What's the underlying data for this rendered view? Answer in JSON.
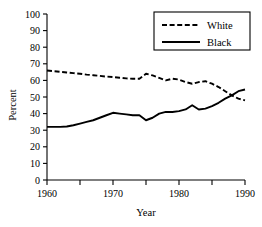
{
  "chart_data": {
    "type": "line",
    "title": "",
    "xlabel": "Year",
    "ylabel": "Percent",
    "xlim": [
      1960,
      1990
    ],
    "ylim": [
      0,
      100
    ],
    "grid": false,
    "legend_position": "top-right",
    "x_ticks_major": [
      1960,
      1970,
      1980,
      1990
    ],
    "x_ticks_minor": [
      1965,
      1975,
      1985
    ],
    "x_tick_labels": [
      "1960",
      "1970",
      "1980",
      "1990"
    ],
    "y_ticks": [
      0,
      10,
      20,
      30,
      40,
      50,
      60,
      70,
      80,
      90,
      100
    ],
    "y_tick_labels": [
      "0",
      "10",
      "20",
      "30",
      "40",
      "50",
      "60",
      "70",
      "80",
      "90",
      "100"
    ],
    "x": [
      1960,
      1961,
      1962,
      1963,
      1964,
      1965,
      1966,
      1967,
      1968,
      1969,
      1970,
      1971,
      1972,
      1973,
      1974,
      1975,
      1976,
      1977,
      1978,
      1979,
      1980,
      1981,
      1982,
      1983,
      1984,
      1985,
      1986,
      1987,
      1988,
      1989,
      1990
    ],
    "series": [
      {
        "name": "White",
        "style": "dashed",
        "color": "#000000",
        "values": [
          66,
          65.6,
          65.2,
          64.8,
          64.4,
          64,
          63.5,
          63.1,
          62.7,
          62.3,
          62,
          61.6,
          61.2,
          61,
          61,
          64,
          63,
          61.5,
          60,
          61,
          60.5,
          59,
          58,
          59,
          59.5,
          58,
          56,
          53.5,
          51,
          49,
          48
        ]
      },
      {
        "name": "Black",
        "style": "solid",
        "color": "#000000",
        "values": [
          32,
          32,
          32,
          32.2,
          33,
          34,
          35,
          36,
          37.5,
          39,
          40.5,
          40,
          39.5,
          39,
          39,
          36,
          37.5,
          40,
          41,
          41,
          41.5,
          42.5,
          45,
          42.5,
          43,
          44.5,
          46.5,
          49,
          51,
          53.5,
          54.5
        ]
      }
    ],
    "legend": [
      {
        "label": "White",
        "style": "dashed"
      },
      {
        "label": "Black",
        "style": "solid"
      }
    ]
  },
  "geometry": {
    "plot_left": 47,
    "plot_right": 245,
    "plot_top": 14,
    "plot_bottom": 180,
    "legend_box": {
      "x": 154,
      "y": 12,
      "width": 96,
      "height": 38
    }
  }
}
